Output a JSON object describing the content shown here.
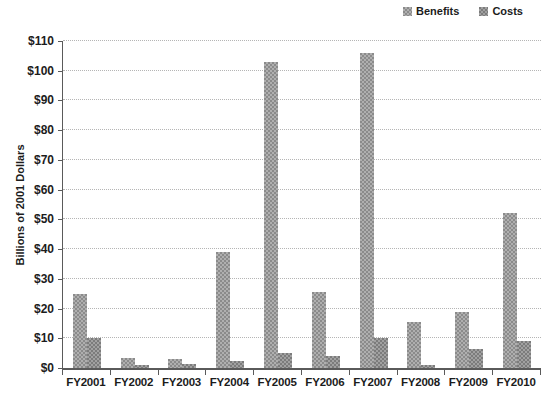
{
  "legend": {
    "items": [
      {
        "label": "Benefits",
        "series_key": "benefits"
      },
      {
        "label": "Costs",
        "series_key": "costs"
      }
    ]
  },
  "colors": {
    "benefits": "#9b9b9b",
    "costs": "#8a8a8a",
    "grid": "#b5b5b5",
    "axis": "#5a5a5a",
    "text": "#1c1c1c"
  },
  "chart_data": {
    "type": "bar",
    "title": "",
    "xlabel": "",
    "ylabel": "Billions of 2001 Dollars",
    "categories": [
      "FY2001",
      "FY2002",
      "FY2003",
      "FY2004",
      "FY2005",
      "FY2006",
      "FY2007",
      "FY2008",
      "FY2009",
      "FY2010"
    ],
    "series": [
      {
        "name": "Benefits",
        "values": [
          25,
          3.5,
          3,
          39,
          103,
          25.5,
          106,
          15.5,
          19,
          52
        ]
      },
      {
        "name": "Costs",
        "values": [
          10,
          1,
          1.5,
          2.5,
          5,
          4,
          10,
          1,
          6.5,
          9
        ]
      }
    ],
    "ylim": [
      0,
      110
    ],
    "ytick_interval": 10,
    "ytick_labels": [
      "$0",
      "$10",
      "$20",
      "$30",
      "$40",
      "$50",
      "$60",
      "$70",
      "$80",
      "$90",
      "$100",
      "$110"
    ],
    "grid": true,
    "legend_position": "top-right"
  }
}
